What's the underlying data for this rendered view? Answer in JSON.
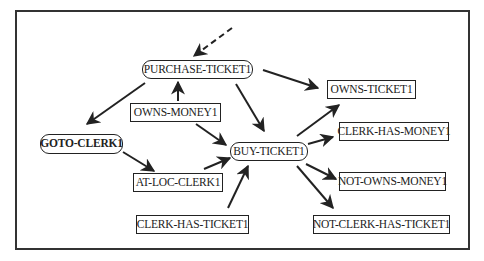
{
  "diagram": {
    "type": "plan-graph",
    "nodes": [
      {
        "id": "purchase-ticket1",
        "label": "PURCHASE-TICKET1",
        "kind": "action",
        "bold": false,
        "x": 142,
        "y": 60,
        "w": 111,
        "h": 19
      },
      {
        "id": "owns-money1",
        "label": "OWNS-MONEY1",
        "kind": "condition",
        "bold": false,
        "x": 130,
        "y": 103,
        "w": 91,
        "h": 19
      },
      {
        "id": "goto-clerk1",
        "label": "GOTO-CLERK1",
        "kind": "action",
        "bold": true,
        "x": 40,
        "y": 134,
        "w": 83,
        "h": 20
      },
      {
        "id": "buy-ticket1",
        "label": "BUY-TICKET1",
        "kind": "action",
        "bold": false,
        "x": 230,
        "y": 142,
        "w": 78,
        "h": 19
      },
      {
        "id": "at-loc-clerk1",
        "label": "AT-LOC-CLERK1",
        "kind": "condition",
        "bold": false,
        "x": 133,
        "y": 173,
        "w": 90,
        "h": 19
      },
      {
        "id": "clerk-has-ticket1",
        "label": "CLERK-HAS-TICKET1",
        "kind": "condition",
        "bold": false,
        "x": 136,
        "y": 215,
        "w": 113,
        "h": 19
      },
      {
        "id": "owns-ticket1",
        "label": "OWNS-TICKET1",
        "kind": "condition",
        "bold": false,
        "x": 327,
        "y": 80,
        "w": 89,
        "h": 19
      },
      {
        "id": "clerk-has-money1",
        "label": "CLERK-HAS-MONEY1",
        "kind": "condition",
        "bold": false,
        "x": 339,
        "y": 122,
        "w": 110,
        "h": 19
      },
      {
        "id": "not-owns-money1",
        "label": "NOT-OWNS-MONEY1",
        "kind": "condition",
        "bold": false,
        "x": 339,
        "y": 172,
        "w": 107,
        "h": 19
      },
      {
        "id": "not-clerk-has-ticket1",
        "label": "NOT-CLERK-HAS-TICKET1",
        "kind": "condition",
        "bold": false,
        "x": 313,
        "y": 215,
        "w": 137,
        "h": 19
      }
    ],
    "edges": [
      {
        "from": "external",
        "to": "purchase-ticket1",
        "style": "dashed",
        "x1": 232,
        "y1": 28,
        "x2": 194,
        "y2": 56
      },
      {
        "from": "owns-money1",
        "to": "purchase-ticket1",
        "style": "solid",
        "x1": 178,
        "y1": 101,
        "x2": 178,
        "y2": 82
      },
      {
        "from": "purchase-ticket1",
        "to": "goto-clerk1",
        "style": "solid",
        "x1": 145,
        "y1": 83,
        "x2": 87,
        "y2": 124
      },
      {
        "from": "purchase-ticket1",
        "to": "owns-ticket1",
        "style": "solid",
        "x1": 263,
        "y1": 70,
        "x2": 318,
        "y2": 88
      },
      {
        "from": "purchase-ticket1",
        "to": "buy-ticket1",
        "style": "solid",
        "x1": 236,
        "y1": 84,
        "x2": 264,
        "y2": 131
      },
      {
        "from": "owns-money1",
        "to": "buy-ticket1",
        "style": "solid",
        "x1": 196,
        "y1": 124,
        "x2": 226,
        "y2": 145
      },
      {
        "from": "goto-clerk1",
        "to": "at-loc-clerk1",
        "style": "solid",
        "x1": 123,
        "y1": 152,
        "x2": 154,
        "y2": 171
      },
      {
        "from": "at-loc-clerk1",
        "to": "buy-ticket1",
        "style": "solid",
        "x1": 204,
        "y1": 169,
        "x2": 230,
        "y2": 158
      },
      {
        "from": "clerk-has-ticket1",
        "to": "buy-ticket1",
        "style": "solid",
        "x1": 228,
        "y1": 208,
        "x2": 248,
        "y2": 166
      },
      {
        "from": "buy-ticket1",
        "to": "owns-ticket1",
        "style": "solid",
        "x1": 297,
        "y1": 136,
        "x2": 339,
        "y2": 105
      },
      {
        "from": "buy-ticket1",
        "to": "clerk-has-money1",
        "style": "solid",
        "x1": 308,
        "y1": 144,
        "x2": 333,
        "y2": 137
      },
      {
        "from": "buy-ticket1",
        "to": "not-owns-money1",
        "style": "solid",
        "x1": 306,
        "y1": 164,
        "x2": 336,
        "y2": 179
      },
      {
        "from": "buy-ticket1",
        "to": "not-clerk-has-ticket1",
        "style": "solid",
        "x1": 297,
        "y1": 166,
        "x2": 333,
        "y2": 208
      }
    ]
  }
}
